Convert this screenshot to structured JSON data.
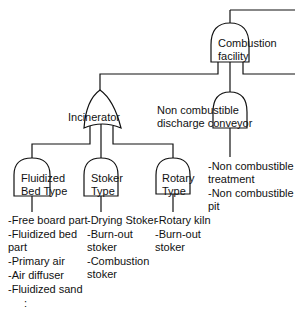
{
  "diagram": {
    "type": "fault-tree",
    "line_color": "#111111",
    "nodes": {
      "root": {
        "label_line1": "Combustion",
        "label_line2": "facility",
        "gate": "AND"
      },
      "incinerator": {
        "label": "Incinerator",
        "gate": "OR"
      },
      "discharge": {
        "label_line1": "Non combustible",
        "label_line2": "discharge conveyor",
        "gate": "AND"
      },
      "fluidized": {
        "label_line1": "Fluidized",
        "label_line2": "Bed Type",
        "gate": "AND"
      },
      "stoker": {
        "label_line1": "Stoker",
        "label_line2": "Type",
        "gate": "AND"
      },
      "rotary": {
        "label_line1": "Rotary",
        "label_line2": "Type",
        "gate": "AND"
      }
    },
    "lists": {
      "fluidized": [
        [
          "-Free board part"
        ],
        [
          "-Fluidized bed",
          "part"
        ],
        [
          "-Primary air"
        ],
        [
          "-Air diffuser"
        ],
        [
          "-Fluidized sand"
        ],
        [
          "   :"
        ]
      ],
      "stoker": [
        [
          "-Drying Stoker"
        ],
        [
          "-Burn-out",
          "stoker"
        ],
        [
          "-Combustion",
          "stoker"
        ]
      ],
      "rotary": [
        [
          "-Rotary kiln"
        ],
        [
          "-Burn-out",
          "stoker"
        ]
      ],
      "discharge": [
        [
          "-Non combustible",
          "treatment"
        ],
        [
          "-Non combustible",
          "pit"
        ]
      ]
    }
  }
}
